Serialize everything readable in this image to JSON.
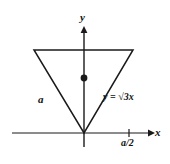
{
  "figure": {
    "type": "geometry-diagram",
    "background_color": "#ffffff",
    "stroke_color": "#1a1a1a",
    "labels": {
      "y_axis": "y",
      "x_axis": "x",
      "side_length": "a",
      "line_equation": "y = √3x",
      "line_equation_parts": {
        "lhs": "y =",
        "radicand": "3",
        "variable": "x"
      },
      "x_tick": "a/2"
    },
    "geometry": {
      "origin": {
        "x": 84,
        "y": 133
      },
      "triangle_vertices": [
        {
          "x": 34,
          "y": 50
        },
        {
          "x": 133,
          "y": 50
        },
        {
          "x": 84,
          "y": 133
        }
      ],
      "centroid_dot": {
        "x": 84,
        "y": 78,
        "radius": 3.4
      },
      "x_axis": {
        "x1": 12,
        "x2": 152,
        "y": 133
      },
      "y_axis": {
        "x": 84,
        "y1": 27,
        "y2": 147
      },
      "x_tick_mark": {
        "x": 129,
        "y": 133,
        "half_height": 4
      }
    }
  }
}
